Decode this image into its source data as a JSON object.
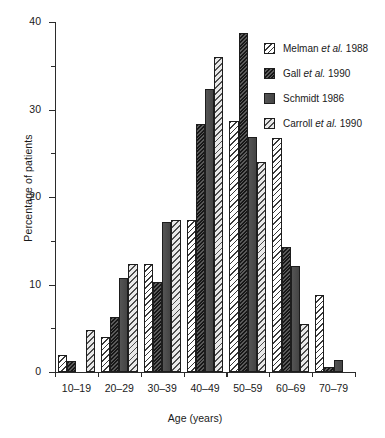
{
  "chart_data": {
    "type": "bar",
    "title": "",
    "xlabel": "Age (years)",
    "ylabel": "Percentage of patients",
    "categories": [
      "10–19",
      "20–29",
      "30–39",
      "40–49",
      "50–59",
      "60–69",
      "70–79"
    ],
    "ylim": [
      0,
      40
    ],
    "yticks": [
      0,
      10,
      20,
      30,
      40
    ],
    "yticks_minor": [
      5,
      15,
      25,
      35
    ],
    "grid": false,
    "legend_position": "top-right",
    "series": [
      {
        "name": "Melman et al. 1988",
        "key": "melman",
        "pattern": "white-sparse-diagonal-hatch",
        "values": [
          2.0,
          4.0,
          12.4,
          17.4,
          28.7,
          26.8,
          8.8
        ]
      },
      {
        "name": "Gall et al. 1990",
        "key": "gall",
        "pattern": "dense-dark-diagonal-hatch",
        "values": [
          1.3,
          6.3,
          10.3,
          28.4,
          38.8,
          14.3,
          0.6
        ]
      },
      {
        "name": "Schmidt 1986",
        "key": "schmidt",
        "pattern": "solid-dark-grey",
        "values": [
          0,
          10.8,
          17.1,
          32.3,
          26.9,
          12.1,
          1.4
        ]
      },
      {
        "name": "Carroll et al. 1990",
        "key": "carroll",
        "pattern": "light-diagonal-hatch",
        "values": [
          4.8,
          12.4,
          17.4,
          36.0,
          24.0,
          5.5,
          0
        ]
      }
    ]
  },
  "legend": {
    "items": [
      {
        "label_pre": "Melman ",
        "label_it": "et al.",
        "label_post": " 1988",
        "key": "melman"
      },
      {
        "label_pre": "Gall ",
        "label_it": "et al.",
        "label_post": " 1990",
        "key": "gall"
      },
      {
        "label_pre": "Schmidt 1986",
        "label_it": "",
        "label_post": "",
        "key": "schmidt"
      },
      {
        "label_pre": "Carroll ",
        "label_it": "et al.",
        "label_post": " 1990",
        "key": "carroll"
      }
    ]
  },
  "axes": {
    "y_label": "Percentage of patients",
    "x_label": "Age (years)",
    "y_tick_labels": [
      "0",
      "10",
      "20",
      "30",
      "40"
    ],
    "x_tick_labels": [
      "10–19",
      "20–29",
      "30–39",
      "40–49",
      "50–59",
      "60–69",
      "70–79"
    ]
  },
  "colors": {
    "axis": "#2b2b2b",
    "bar_outline": "#1d1d1d",
    "background": "#ffffff",
    "melman": "#ffffff",
    "gall": "#2a2a2a",
    "schmidt": "#4a4a4a",
    "carroll": "#e3e3e3"
  }
}
